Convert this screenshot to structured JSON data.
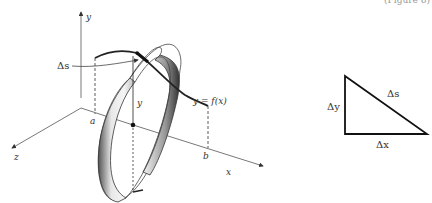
{
  "figure": {
    "top_cut_text": "(Figure 6)",
    "surface_diagram": {
      "axes": {
        "x_label": "x",
        "y_label": "y",
        "z_label": "z"
      },
      "labels": {
        "arc_length": "Δs",
        "height": "y",
        "curve": "y = f(x)",
        "a": "a",
        "b": "b"
      }
    },
    "triangle": {
      "hypotenuse": "Δs",
      "vertical_leg": "Δy",
      "horizontal_leg": "Δx"
    }
  }
}
